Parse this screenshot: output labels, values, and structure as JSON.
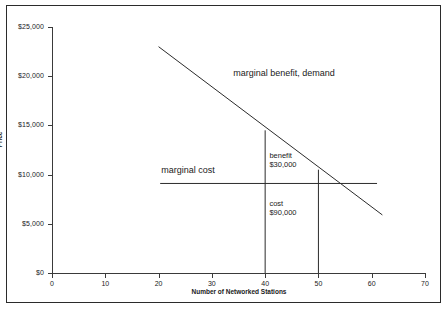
{
  "chart_data": {
    "type": "line",
    "title": "",
    "xlabel": "Number of Networked Stations",
    "ylabel": "Price",
    "xlim": [
      0,
      70
    ],
    "ylim": [
      0,
      25000
    ],
    "grid": false,
    "legend_position": "inline-annotations",
    "x_ticks": [
      {
        "value": 0,
        "label": "0"
      },
      {
        "value": 10,
        "label": "10"
      },
      {
        "value": 20,
        "label": "20"
      },
      {
        "value": 30,
        "label": "30"
      },
      {
        "value": 40,
        "label": "40"
      },
      {
        "value": 50,
        "label": "50"
      },
      {
        "value": 60,
        "label": "60"
      },
      {
        "value": 70,
        "label": "70"
      }
    ],
    "y_ticks": [
      {
        "value": 0,
        "label": "$0"
      },
      {
        "value": 5000,
        "label": "$5,000"
      },
      {
        "value": 10000,
        "label": "$10,000"
      },
      {
        "value": 15000,
        "label": "$15,000"
      },
      {
        "value": 20000,
        "label": "$20,000"
      },
      {
        "value": 25000,
        "label": "$25,000"
      }
    ],
    "series": [
      {
        "name": "marginal benefit, demand",
        "type": "line",
        "points": [
          [
            20,
            23000
          ],
          [
            62,
            5900
          ]
        ]
      },
      {
        "name": "marginal cost",
        "type": "line",
        "points": [
          [
            20.3,
            9100
          ],
          [
            61,
            9100
          ]
        ]
      }
    ],
    "drop_lines": [
      {
        "name": "quantity-40-dropline",
        "x": 40,
        "y_top": 14500,
        "y_bottom": 0
      },
      {
        "name": "quantity-50-dropline",
        "x": 50,
        "y_top": 10500,
        "y_bottom": 0
      }
    ],
    "annotations": [
      {
        "name": "demand-label",
        "text": "marginal benefit, demand",
        "x": 34,
        "y": 20300
      },
      {
        "name": "marginal-cost-label",
        "text": "marginal cost",
        "x": 20.5,
        "y": 10500
      },
      {
        "name": "benefit-label-line1",
        "text": "benefit",
        "x": 40.8,
        "y": 11900
      },
      {
        "name": "benefit-label-line2",
        "text": "$30,000",
        "x": 40.8,
        "y": 11000
      },
      {
        "name": "cost-label-line1",
        "text": "cost",
        "x": 40.8,
        "y": 7000
      },
      {
        "name": "cost-label-line2",
        "text": "$90,000",
        "x": 40.8,
        "y": 6100
      }
    ]
  },
  "axis": {
    "x_title": "Number of Networked Stations",
    "y_title": "Price"
  },
  "labels": {
    "demand": "marginal benefit, demand",
    "marginal_cost": "marginal cost",
    "benefit_title": "benefit",
    "benefit_value": "$30,000",
    "cost_title": "cost",
    "cost_value": "$90,000"
  },
  "colors": {
    "line": "#2b2b2b",
    "axis": "#3a3a3a",
    "background": "#ffffff",
    "text": "#1a1a1a"
  }
}
